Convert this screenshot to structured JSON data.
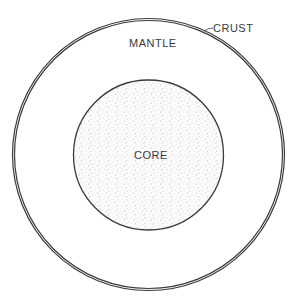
{
  "diagram": {
    "labels": {
      "crust": "CRUST",
      "mantle": "MANTLE",
      "core": "CORE"
    },
    "layers": [
      {
        "name": "crust",
        "cx": 148.5,
        "cy": 154.5,
        "r": 136,
        "style": "double-line"
      },
      {
        "name": "mantle",
        "cx": 148.5,
        "cy": 154.5,
        "r": 134,
        "fill": "#ffffff"
      },
      {
        "name": "core",
        "cx": 148.5,
        "cy": 155,
        "r": 75,
        "fill": "stippled"
      }
    ],
    "colors": {
      "line": "#3a3a3a",
      "stipple": "#8a8a8a",
      "background": "#ffffff"
    }
  }
}
